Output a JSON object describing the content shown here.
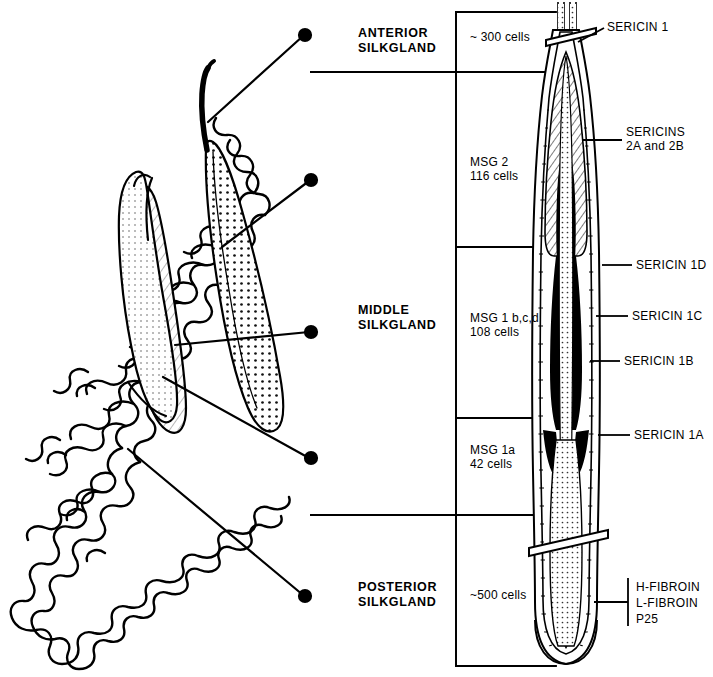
{
  "figure": {
    "type": "labeled-anatomical-diagram",
    "ink_color": "#000000",
    "background_color": "#ffffff"
  },
  "regions": [
    {
      "name": "anterior",
      "label": "ANTERIOR\nSILKGLAND",
      "cells": "~ 300 cells"
    },
    {
      "name": "msg2",
      "label": "",
      "cells": "MSG 2\n116 cells"
    },
    {
      "name": "middle",
      "label": "MIDDLE\nSILKGLAND",
      "cells": "MSG 1 b,c,d\n108 cells"
    },
    {
      "name": "msg1a",
      "label": "",
      "cells": "MSG 1a\n42 cells"
    },
    {
      "name": "posterior",
      "label": "POSTERIOR\nSILKGLAND",
      "cells": "~500 cells"
    }
  ],
  "region_labels": {
    "anterior": "ANTERIOR\nSILKGLAND",
    "middle": "MIDDLE\nSILKGLAND",
    "posterior": "POSTERIOR\nSILKGLAND"
  },
  "cell_counts": {
    "anterior": "~ 300 cells",
    "msg2": "MSG 2\n116 cells",
    "msg1bcd": "MSG 1 b,c,d\n108 cells",
    "msg1a": "MSG 1a\n42 cells",
    "posterior": "~500 cells"
  },
  "products": [
    {
      "key": "sericin1",
      "label": "SERICIN 1"
    },
    {
      "key": "sericins2",
      "label": "SERICINS\n2A and 2B"
    },
    {
      "key": "sericin1d",
      "label": "SERICIN 1D"
    },
    {
      "key": "sericin1c",
      "label": "SERICIN 1C"
    },
    {
      "key": "sericin1b",
      "label": "SERICIN 1B"
    },
    {
      "key": "sericin1a",
      "label": "SERICIN 1A"
    },
    {
      "key": "fibroins",
      "label": "H-FIBROIN\nL-FIBROIN\nP25"
    }
  ],
  "product_labels": {
    "sericin1": "SERICIN 1",
    "sericins2": "SERICINS\n2A and 2B",
    "sericin1d": "SERICIN 1D",
    "sericin1c": "SERICIN 1C",
    "sericin1b": "SERICIN 1B",
    "sericin1a": "SERICIN 1A",
    "fibroins": "H-FIBROIN\nL-FIBROIN\nP25"
  },
  "fibroin_lines": {
    "line1": "H-FIBROIN",
    "line2": "L-FIBROIN",
    "line3": "P25"
  }
}
